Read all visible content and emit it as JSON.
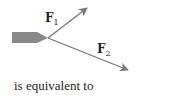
{
  "diagram": {
    "colors": {
      "arrow": "#777777",
      "tail": "#888888",
      "text": "#222222"
    },
    "forces": [
      {
        "name": "F",
        "subscript": "1"
      },
      {
        "name": "F",
        "subscript": "2"
      }
    ],
    "caption": "is equivalent to"
  }
}
